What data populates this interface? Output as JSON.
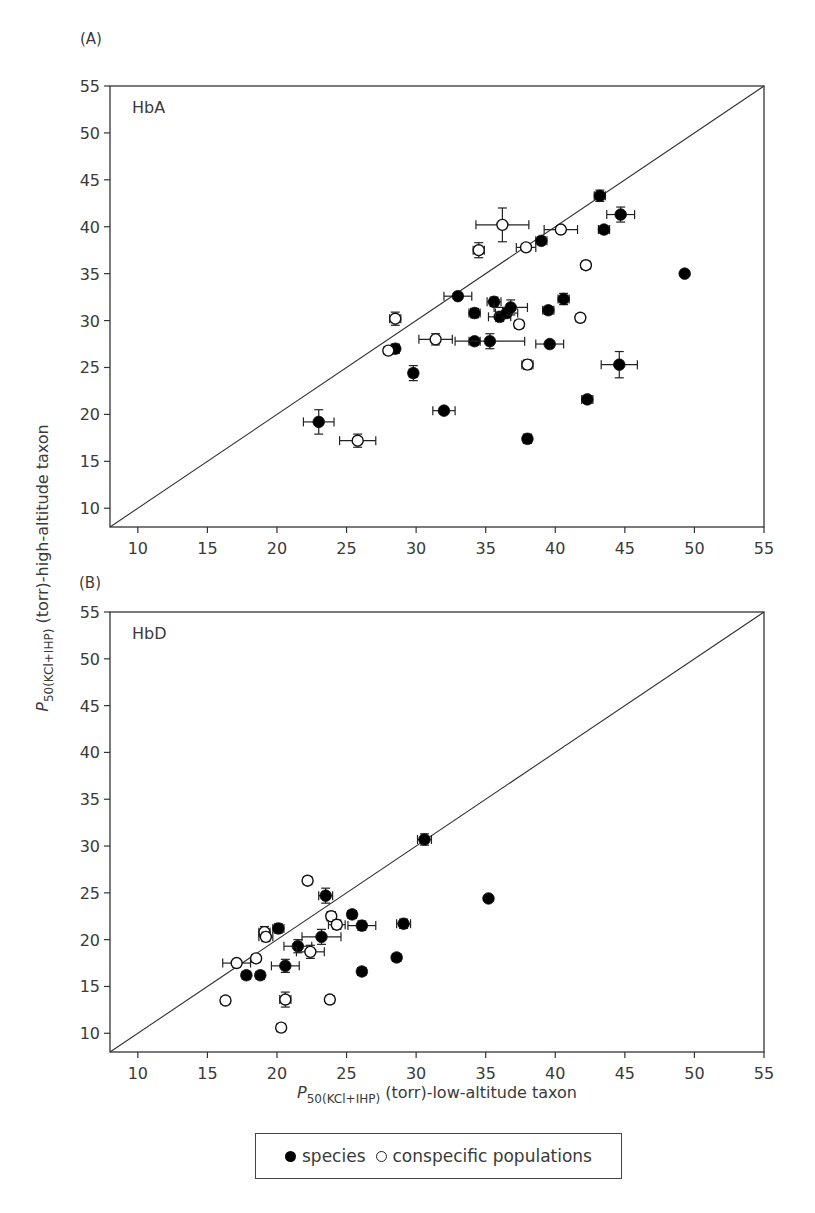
{
  "chart_data": [
    {
      "type": "scatter",
      "panel": "(A)",
      "title": "HbA",
      "xlabel": "P50(KCl+IHP) (torr)-low-altitude taxon",
      "ylabel": "P50(KCl+IHP) (torr)-high-altitude taxon",
      "xlim": [
        8,
        55
      ],
      "ylim": [
        8,
        55
      ],
      "xticks": [
        10,
        15,
        20,
        25,
        30,
        35,
        40,
        45,
        50,
        55
      ],
      "yticks": [
        10,
        15,
        20,
        25,
        30,
        35,
        40,
        45,
        50,
        55
      ],
      "grid": false,
      "reference_line": "y = x",
      "series": [
        {
          "name": "species",
          "marker": "filled-circle",
          "points": [
            {
              "x": 23.0,
              "y": 19.2,
              "xerr": 1.1,
              "yerr": 1.3
            },
            {
              "x": 28.5,
              "y": 27.0,
              "xerr": 0.3,
              "yerr": 0.5
            },
            {
              "x": 29.8,
              "y": 24.4,
              "xerr": 0.3,
              "yerr": 0.8
            },
            {
              "x": 32.0,
              "y": 20.4,
              "xerr": 0.8,
              "yerr": 0.3
            },
            {
              "x": 33.0,
              "y": 32.6,
              "xerr": 1.0,
              "yerr": 0.3
            },
            {
              "x": 34.2,
              "y": 30.8,
              "xerr": 0.4,
              "yerr": 0.5
            },
            {
              "x": 34.2,
              "y": 27.8,
              "xerr": 0.4,
              "yerr": 0.3
            },
            {
              "x": 35.3,
              "y": 27.8,
              "xerr": 2.5,
              "yerr": 0.8
            },
            {
              "x": 35.6,
              "y": 32.0,
              "xerr": 0.5,
              "yerr": 0.5
            },
            {
              "x": 36.0,
              "y": 30.4,
              "xerr": 0.8,
              "yerr": 0.5
            },
            {
              "x": 36.5,
              "y": 30.8,
              "xerr": 0.8,
              "yerr": 0.5
            },
            {
              "x": 36.8,
              "y": 31.4,
              "xerr": 1.2,
              "yerr": 0.8
            },
            {
              "x": 38.0,
              "y": 17.4,
              "xerr": 0.3,
              "yerr": 0.5
            },
            {
              "x": 39.0,
              "y": 38.5,
              "xerr": 0.4,
              "yerr": 0.4
            },
            {
              "x": 39.5,
              "y": 31.1,
              "xerr": 0.4,
              "yerr": 0.4
            },
            {
              "x": 39.6,
              "y": 27.5,
              "xerr": 1.0,
              "yerr": 0.3
            },
            {
              "x": 40.6,
              "y": 32.3,
              "xerr": 0.4,
              "yerr": 0.6
            },
            {
              "x": 42.3,
              "y": 21.6,
              "xerr": 0.4,
              "yerr": 0.4
            },
            {
              "x": 43.2,
              "y": 43.3,
              "xerr": 0.4,
              "yerr": 0.6
            },
            {
              "x": 43.5,
              "y": 39.7,
              "xerr": 0.4,
              "yerr": 0.4
            },
            {
              "x": 44.6,
              "y": 25.3,
              "xerr": 1.3,
              "yerr": 1.4
            },
            {
              "x": 44.7,
              "y": 41.3,
              "xerr": 1.0,
              "yerr": 0.8
            },
            {
              "x": 49.3,
              "y": 35.0,
              "xerr": 0,
              "yerr": 0
            }
          ]
        },
        {
          "name": "conspecific populations",
          "marker": "open-circle",
          "points": [
            {
              "x": 25.8,
              "y": 17.2,
              "xerr": 1.3,
              "yerr": 0.7
            },
            {
              "x": 28.0,
              "y": 26.8,
              "xerr": 0.3,
              "yerr": 0.3
            },
            {
              "x": 28.5,
              "y": 30.2,
              "xerr": 0.4,
              "yerr": 0.7
            },
            {
              "x": 31.4,
              "y": 28.0,
              "xerr": 1.2,
              "yerr": 0.6
            },
            {
              "x": 34.5,
              "y": 37.5,
              "xerr": 0.4,
              "yerr": 0.8
            },
            {
              "x": 36.2,
              "y": 40.2,
              "xerr": 1.9,
              "yerr": 1.8
            },
            {
              "x": 37.4,
              "y": 29.6,
              "xerr": 0.3,
              "yerr": 0.4
            },
            {
              "x": 37.9,
              "y": 37.8,
              "xerr": 0.7,
              "yerr": 0.3
            },
            {
              "x": 38.0,
              "y": 25.3,
              "xerr": 0.4,
              "yerr": 0.5
            },
            {
              "x": 40.4,
              "y": 39.7,
              "xerr": 1.2,
              "yerr": 0.3
            },
            {
              "x": 41.8,
              "y": 30.3,
              "xerr": 0.3,
              "yerr": 0.3
            },
            {
              "x": 42.2,
              "y": 35.9,
              "xerr": 0.3,
              "yerr": 0.4
            }
          ]
        }
      ]
    },
    {
      "type": "scatter",
      "panel": "(B)",
      "title": "HbD",
      "xlabel": "P50(KCl+IHP) (torr)-low-altitude taxon",
      "ylabel": "P50(KCl+IHP) (torr)-high-altitude taxon",
      "xlim": [
        8,
        55
      ],
      "ylim": [
        8,
        55
      ],
      "xticks": [
        10,
        15,
        20,
        25,
        30,
        35,
        40,
        45,
        50,
        55
      ],
      "yticks": [
        10,
        15,
        20,
        25,
        30,
        35,
        40,
        45,
        50,
        55
      ],
      "grid": false,
      "reference_line": "y = x",
      "series": [
        {
          "name": "species",
          "marker": "filled-circle",
          "points": [
            {
              "x": 17.8,
              "y": 16.2,
              "xerr": 0.3,
              "yerr": 0.3
            },
            {
              "x": 18.8,
              "y": 16.2,
              "xerr": 0.3,
              "yerr": 0.3
            },
            {
              "x": 20.1,
              "y": 21.2,
              "xerr": 0.4,
              "yerr": 0.5
            },
            {
              "x": 20.6,
              "y": 17.2,
              "xerr": 1.0,
              "yerr": 0.7
            },
            {
              "x": 21.5,
              "y": 19.3,
              "xerr": 1.0,
              "yerr": 0.7
            },
            {
              "x": 23.2,
              "y": 20.3,
              "xerr": 1.4,
              "yerr": 0.8
            },
            {
              "x": 23.5,
              "y": 24.7,
              "xerr": 0.5,
              "yerr": 0.8
            },
            {
              "x": 25.4,
              "y": 22.7,
              "xerr": 0.3,
              "yerr": 0.4
            },
            {
              "x": 26.1,
              "y": 21.5,
              "xerr": 1.0,
              "yerr": 0.5
            },
            {
              "x": 26.1,
              "y": 16.6,
              "xerr": 0.3,
              "yerr": 0.3
            },
            {
              "x": 28.6,
              "y": 18.1,
              "xerr": 0.3,
              "yerr": 0.3
            },
            {
              "x": 29.1,
              "y": 21.7,
              "xerr": 0.5,
              "yerr": 0.5
            },
            {
              "x": 30.6,
              "y": 30.7,
              "xerr": 0.5,
              "yerr": 0.6
            },
            {
              "x": 35.2,
              "y": 24.4,
              "xerr": 0,
              "yerr": 0
            }
          ]
        },
        {
          "name": "conspecific populations",
          "marker": "open-circle",
          "points": [
            {
              "x": 16.3,
              "y": 13.5,
              "xerr": 0.3,
              "yerr": 0.3
            },
            {
              "x": 17.1,
              "y": 17.5,
              "xerr": 1.0,
              "yerr": 0.4
            },
            {
              "x": 18.5,
              "y": 18.0,
              "xerr": 0.3,
              "yerr": 0.3
            },
            {
              "x": 19.1,
              "y": 20.8,
              "xerr": 0.4,
              "yerr": 0.6
            },
            {
              "x": 19.2,
              "y": 20.3,
              "xerr": 0.5,
              "yerr": 0.5
            },
            {
              "x": 20.3,
              "y": 10.6,
              "xerr": 0.3,
              "yerr": 0.3
            },
            {
              "x": 20.6,
              "y": 13.6,
              "xerr": 0.4,
              "yerr": 0.8
            },
            {
              "x": 22.2,
              "y": 26.3,
              "xerr": 0.3,
              "yerr": 0.3
            },
            {
              "x": 22.4,
              "y": 18.7,
              "xerr": 1.0,
              "yerr": 0.7
            },
            {
              "x": 23.9,
              "y": 22.5,
              "xerr": 0.3,
              "yerr": 0.5
            },
            {
              "x": 24.3,
              "y": 21.6,
              "xerr": 0.6,
              "yerr": 0.5
            },
            {
              "x": 23.8,
              "y": 13.6,
              "xerr": 0.3,
              "yerr": 0.3
            }
          ]
        }
      ]
    }
  ],
  "figure": {
    "panel_a_label": "(A)",
    "panel_b_label": "(B)",
    "panel_a_title": "HbA",
    "panel_b_title": "HbD",
    "y_axis_title_main": "P",
    "y_axis_title_sub": "50(KCl+IHP)",
    "y_axis_title_rest": " (torr)-high-altitude taxon",
    "x_axis_title_main": "P",
    "x_axis_title_sub": "50(KCl+IHP)",
    "x_axis_title_rest": " (torr)-low-altitude taxon"
  },
  "legend": {
    "items": [
      {
        "label": "species",
        "marker": "filled-circle",
        "color": "#000000"
      },
      {
        "label": "conspecific populations",
        "marker": "open-circle",
        "color": "#222222"
      }
    ]
  },
  "colors": {
    "axis": "#333333",
    "marker_fill": "#000000",
    "text": "#3a3a3a"
  }
}
